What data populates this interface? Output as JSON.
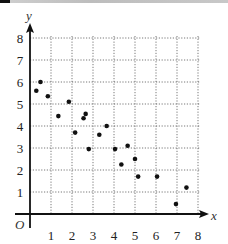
{
  "chart_data": {
    "type": "scatter",
    "title": "",
    "xlabel": "x",
    "ylabel": "y",
    "origin_label": "O",
    "xlim": [
      0,
      8
    ],
    "ylim": [
      0,
      8
    ],
    "grid": "dotted",
    "x_ticks": [
      "1",
      "2",
      "3",
      "4",
      "5",
      "6",
      "7",
      "8"
    ],
    "y_ticks": [
      "1",
      "2",
      "3",
      "4",
      "5",
      "6",
      "7",
      "8"
    ],
    "points": [
      {
        "x": 0.3,
        "y": 5.6
      },
      {
        "x": 0.5,
        "y": 6.0
      },
      {
        "x": 0.85,
        "y": 5.35
      },
      {
        "x": 1.35,
        "y": 4.45
      },
      {
        "x": 1.85,
        "y": 5.1
      },
      {
        "x": 2.15,
        "y": 3.7
      },
      {
        "x": 2.55,
        "y": 4.35
      },
      {
        "x": 2.65,
        "y": 4.55
      },
      {
        "x": 2.8,
        "y": 2.95
      },
      {
        "x": 3.3,
        "y": 3.6
      },
      {
        "x": 3.65,
        "y": 4.0
      },
      {
        "x": 4.05,
        "y": 2.95
      },
      {
        "x": 4.35,
        "y": 2.25
      },
      {
        "x": 4.65,
        "y": 3.1
      },
      {
        "x": 5.0,
        "y": 2.5
      },
      {
        "x": 5.15,
        "y": 1.7
      },
      {
        "x": 6.05,
        "y": 1.7
      },
      {
        "x": 6.95,
        "y": 0.45
      },
      {
        "x": 7.45,
        "y": 1.2
      }
    ]
  },
  "colors": {
    "axis": "#111111",
    "grid": "#555555",
    "point": "#111111"
  }
}
